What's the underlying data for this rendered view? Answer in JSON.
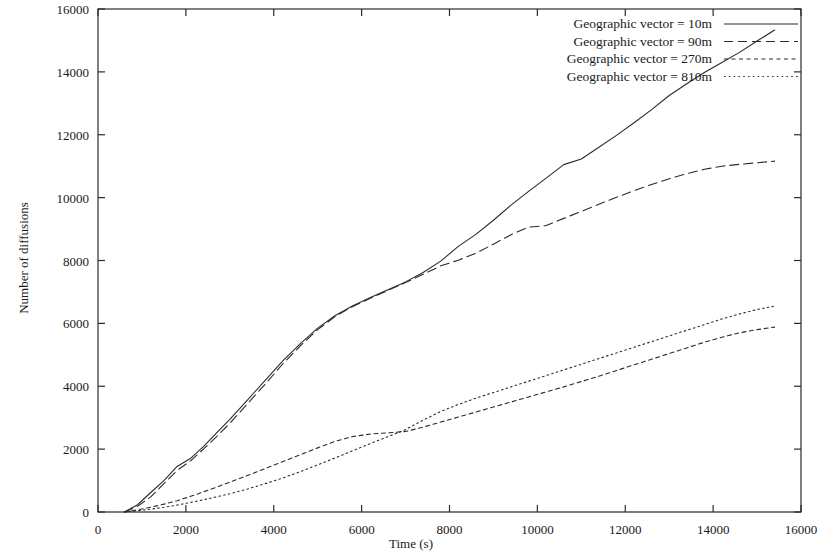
{
  "chart_data": {
    "type": "line",
    "title": "",
    "xlabel": "Time (s)",
    "ylabel": "Number of diffusions",
    "xlim": [
      0,
      16000
    ],
    "ylim": [
      0,
      16000
    ],
    "xticks": [
      0,
      2000,
      4000,
      6000,
      8000,
      10000,
      12000,
      14000,
      16000
    ],
    "yticks": [
      0,
      2000,
      4000,
      6000,
      8000,
      10000,
      12000,
      14000,
      16000
    ],
    "xtick_labels": [
      "0",
      "2000",
      "4000",
      "6000",
      "8000",
      "10000",
      "12000",
      "14000",
      "16000"
    ],
    "ytick_labels": [
      "0",
      "2000",
      "4000",
      "6000",
      "8000",
      "10000",
      "12000",
      "14000",
      "16000"
    ],
    "grid": false,
    "legend_position": "top-right",
    "line_color": "#2b2b2b",
    "series": [
      {
        "name": "Geographic vector = 10m",
        "dash": "solid",
        "x": [
          600,
          900,
          1200,
          1500,
          1800,
          2100,
          2400,
          2700,
          3000,
          3400,
          3800,
          4200,
          4600,
          5000,
          5400,
          5800,
          6200,
          6600,
          7000,
          7400,
          7800,
          8200,
          8600,
          9000,
          9400,
          9800,
          10200,
          10600,
          11000,
          11400,
          11800,
          12200,
          12600,
          13000,
          13400,
          13800,
          14200,
          14600,
          15000,
          15400
        ],
        "y": [
          0,
          230,
          620,
          1000,
          1450,
          1700,
          2080,
          2520,
          2950,
          3560,
          4180,
          4800,
          5350,
          5850,
          6250,
          6560,
          6820,
          7070,
          7320,
          7620,
          7980,
          8450,
          8830,
          9280,
          9760,
          10200,
          10620,
          11050,
          11230,
          11600,
          11980,
          12380,
          12800,
          13250,
          13620,
          13980,
          14300,
          14620,
          14980,
          15330
        ]
      },
      {
        "name": "Geographic vector = 90m",
        "dash": "dashed",
        "x": [
          600,
          900,
          1200,
          1500,
          1800,
          2100,
          2400,
          2700,
          3000,
          3400,
          3800,
          4200,
          4600,
          5000,
          5400,
          5800,
          6200,
          6600,
          7000,
          7400,
          7800,
          8200,
          8600,
          9000,
          9400,
          9800,
          10200,
          10600,
          11000,
          11400,
          11800,
          12200,
          12600,
          13000,
          13400,
          13800,
          14200,
          14600,
          15000,
          15400
        ],
        "y": [
          0,
          180,
          480,
          900,
          1320,
          1620,
          2000,
          2400,
          2820,
          3440,
          4060,
          4700,
          5280,
          5800,
          6220,
          6540,
          6800,
          7050,
          7300,
          7560,
          7830,
          8010,
          8230,
          8520,
          8820,
          9060,
          9110,
          9340,
          9560,
          9790,
          10010,
          10220,
          10420,
          10600,
          10760,
          10900,
          11000,
          11060,
          11110,
          11160
        ]
      },
      {
        "name": "Geographic vector = 270m",
        "dash": "shortdash",
        "x": [
          600,
          900,
          1200,
          1500,
          1800,
          2200,
          2600,
          3000,
          3400,
          3800,
          4200,
          4600,
          5000,
          5400,
          5800,
          6200,
          6600,
          7000,
          7400,
          7800,
          8200,
          8600,
          9000,
          9400,
          9800,
          10200,
          10600,
          11000,
          11400,
          11800,
          12200,
          12600,
          13000,
          13400,
          13800,
          14200,
          14600,
          15000,
          15400
        ],
        "y": [
          0,
          70,
          150,
          250,
          360,
          540,
          740,
          950,
          1160,
          1380,
          1600,
          1820,
          2040,
          2250,
          2400,
          2480,
          2520,
          2560,
          2700,
          2860,
          3020,
          3180,
          3340,
          3500,
          3660,
          3820,
          3980,
          4150,
          4320,
          4500,
          4680,
          4860,
          5040,
          5220,
          5400,
          5560,
          5700,
          5800,
          5880
        ]
      },
      {
        "name": "Geographic vector = 810m",
        "dash": "dotted",
        "x": [
          600,
          900,
          1200,
          1500,
          1800,
          2200,
          2600,
          3000,
          3400,
          3800,
          4200,
          4600,
          5000,
          5400,
          5800,
          6200,
          6600,
          7000,
          7400,
          7800,
          8200,
          8600,
          9000,
          9400,
          9800,
          10200,
          10600,
          11000,
          11400,
          11800,
          12200,
          12600,
          13000,
          13400,
          13800,
          14200,
          14600,
          15000,
          15400
        ],
        "y": [
          0,
          40,
          90,
          150,
          220,
          330,
          450,
          580,
          730,
          900,
          1080,
          1280,
          1500,
          1720,
          1950,
          2180,
          2400,
          2620,
          2920,
          3200,
          3420,
          3620,
          3800,
          3980,
          4160,
          4340,
          4520,
          4700,
          4880,
          5060,
          5240,
          5420,
          5600,
          5780,
          5960,
          6140,
          6300,
          6440,
          6550
        ]
      }
    ]
  },
  "legend": {
    "items": [
      "Geographic vector = 10m",
      "Geographic vector = 90m",
      "Geographic vector = 270m",
      "Geographic vector = 810m"
    ]
  }
}
